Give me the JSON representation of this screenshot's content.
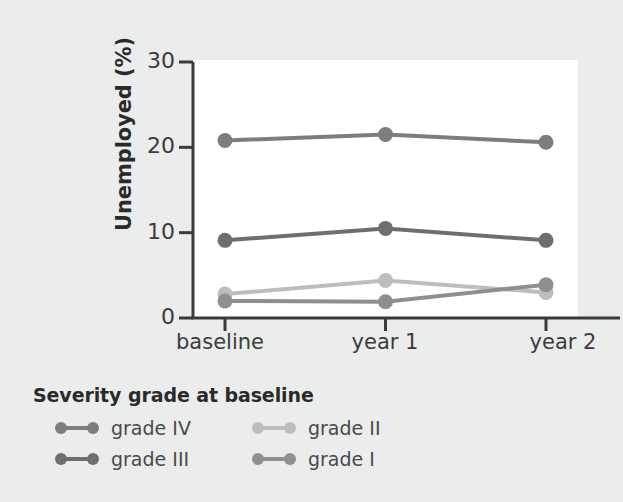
{
  "chart_data": {
    "type": "line",
    "title": "",
    "xlabel": "",
    "ylabel": "Unemployed (%)",
    "categories": [
      "baseline",
      "year 1",
      "year 2"
    ],
    "yticks": [
      0,
      10,
      20,
      30
    ],
    "ylim": [
      0,
      30
    ],
    "grid": false,
    "legend_position": "below-left",
    "legend_title": "Severity grade at baseline",
    "series": [
      {
        "name": "grade IV",
        "values": [
          20.8,
          21.5,
          20.6
        ],
        "color": "#7d7d7d"
      },
      {
        "name": "grade III",
        "values": [
          9.1,
          10.5,
          9.1
        ],
        "color": "#6e6e6e"
      },
      {
        "name": "grade II",
        "values": [
          2.8,
          4.4,
          3.0
        ],
        "color": "#bdbdbd"
      },
      {
        "name": "grade I",
        "values": [
          2.0,
          1.9,
          3.9
        ],
        "color": "#8f8f8f"
      }
    ]
  },
  "axis": {
    "ytick_labels": [
      "30",
      "20",
      "10",
      "0"
    ],
    "xtick_labels": [
      "baseline",
      "year 1",
      "year 2"
    ],
    "ylabel_text": "Unemployed (%)",
    "axis_color": "#3a3a3a"
  },
  "legend": {
    "title": "Severity grade at baseline",
    "items": [
      {
        "label": "grade IV",
        "color": "#7d7d7d"
      },
      {
        "label": "grade III",
        "color": "#6e6e6e"
      },
      {
        "label": "grade II",
        "color": "#bdbdbd"
      },
      {
        "label": "grade I",
        "color": "#8f8f8f"
      }
    ]
  },
  "colors": {
    "background": "#ebecec",
    "plot_background": "#ffffff",
    "text": "#3b3b3b",
    "axis": "#3a3a3a"
  }
}
